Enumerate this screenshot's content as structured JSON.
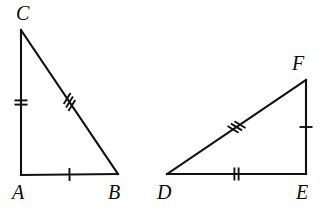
{
  "figure": {
    "background_color": "#ffffff",
    "stroke_color": "#111111",
    "label_color": "#0b0b0b",
    "width": 323,
    "height": 211
  },
  "triangles": [
    {
      "id": "triangle-abc",
      "name": "Triangle ABC",
      "right_angle_at": "A",
      "vertices": [
        {
          "id": "A",
          "label": "A",
          "x": 21,
          "y": 175,
          "label_x": 12,
          "label_y": 182
        },
        {
          "id": "B",
          "label": "B",
          "x": 118,
          "y": 174,
          "label_x": 108,
          "label_y": 182
        },
        {
          "id": "C",
          "label": "C",
          "x": 21,
          "y": 30,
          "label_x": 16,
          "label_y": 3
        }
      ],
      "sides": [
        {
          "id": "AC",
          "from": "A",
          "to": "C",
          "ticks": 2,
          "tick_label": "two tick marks"
        },
        {
          "id": "CB",
          "from": "C",
          "to": "B",
          "ticks": 3,
          "tick_label": "three tick marks"
        },
        {
          "id": "AB",
          "from": "A",
          "to": "B",
          "ticks": 1,
          "tick_label": "one tick mark"
        }
      ]
    },
    {
      "id": "triangle-def",
      "name": "Triangle DEF",
      "right_angle_at": "E",
      "vertices": [
        {
          "id": "D",
          "label": "D",
          "x": 167,
          "y": 174,
          "label_x": 157,
          "label_y": 182
        },
        {
          "id": "E",
          "label": "E",
          "x": 306,
          "y": 174,
          "label_x": 296,
          "label_y": 182
        },
        {
          "id": "F",
          "label": "F",
          "x": 306,
          "y": 80,
          "label_x": 292,
          "label_y": 53
        }
      ],
      "sides": [
        {
          "id": "DF",
          "from": "D",
          "to": "F",
          "ticks": 3,
          "tick_label": "three tick marks"
        },
        {
          "id": "DE",
          "from": "D",
          "to": "E",
          "ticks": 2,
          "tick_label": "two tick marks"
        },
        {
          "id": "FE",
          "from": "F",
          "to": "E",
          "ticks": 1,
          "tick_label": "one tick mark"
        }
      ]
    }
  ]
}
